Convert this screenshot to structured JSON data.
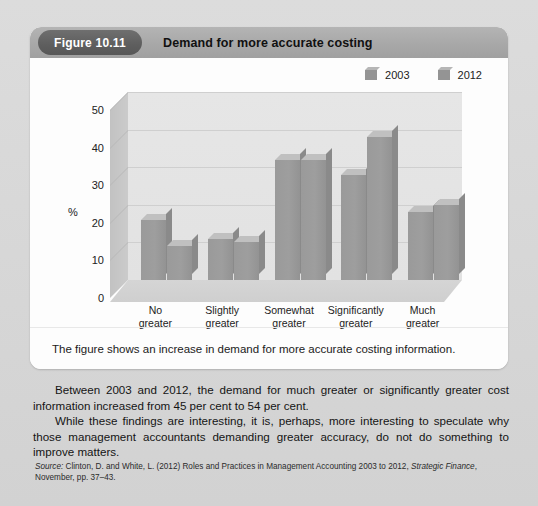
{
  "figure": {
    "badge": "Figure 10.11",
    "title": "Demand for more accurate costing",
    "caption": "The figure shows an increase in demand for more accurate costing information."
  },
  "legend": [
    {
      "label": "2003"
    },
    {
      "label": "2012"
    }
  ],
  "chart_data": {
    "type": "bar",
    "title": "Demand for more accurate costing",
    "categories": [
      "No greater",
      "Slightly greater",
      "Somewhat greater",
      "Significantly greater",
      "Much greater"
    ],
    "category_lines": [
      [
        "No",
        "greater"
      ],
      [
        "Slightly",
        "greater"
      ],
      [
        "Somewhat",
        "greater"
      ],
      [
        "Significantly",
        "greater"
      ],
      [
        "Much",
        "greater"
      ]
    ],
    "series": [
      {
        "name": "2003",
        "values": [
          16,
          11,
          32,
          28,
          18
        ]
      },
      {
        "name": "2012",
        "values": [
          9,
          10,
          32,
          38,
          20
        ]
      }
    ],
    "xlabel": "",
    "ylabel": "%",
    "ylim": [
      0,
      50
    ],
    "yticks": [
      0,
      10,
      20,
      30,
      40,
      50
    ],
    "ytick_labels": [
      "0",
      "10",
      "20",
      "30",
      "40",
      "50"
    ],
    "grid": true,
    "legend_position": "top-right",
    "bar_color": "#9a9a9a",
    "plot_bg": "#e4e4e4"
  },
  "body": {
    "paragraph1": "Between 2003 and 2012, the demand for much greater or significantly greater cost information increased from 45 per cent to 54 per cent.",
    "paragraph2": "While these findings are interesting, it is, perhaps, more interesting to speculate why those management accountants demanding greater accuracy, do not do something to improve matters."
  },
  "source": {
    "prefix": "Source:",
    "text_before_italic": " Clinton, D. and White, L. (2012) Roles and Practices in Management Accounting 2003 to 2012, ",
    "italic": "Strategic Finance",
    "text_after_italic": ", November, pp. 37–43."
  }
}
